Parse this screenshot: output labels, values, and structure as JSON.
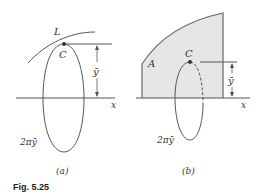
{
  "figure": {
    "caption": "Fig. 5.25",
    "colors": {
      "ink": "#444444",
      "fill": "#e6e6e6",
      "outline": "#666666"
    },
    "panel_a": {
      "sublabel": "(a)",
      "curve_label": "L",
      "centroid_label": "C",
      "distance_label": "ȳ",
      "axis_label": "x",
      "path_label": "2πȳ"
    },
    "panel_b": {
      "sublabel": "(b)",
      "area_label": "A",
      "centroid_label": "C",
      "distance_label": "ȳ",
      "axis_label": "x",
      "path_label": "2πȳ"
    }
  }
}
